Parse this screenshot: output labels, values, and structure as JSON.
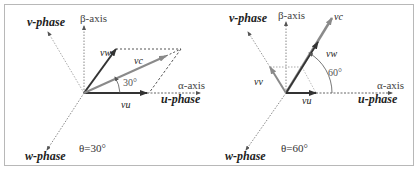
{
  "panels": [
    {
      "id": "left",
      "theta_label": "θ=30°",
      "labels": {
        "v_phase": "v-phase",
        "u_phase": "u-phase",
        "w_phase": "w-phase",
        "beta_axis": "β-axis",
        "alpha_axis": "α-axis",
        "vec_u": "vu",
        "vec_w": "vw",
        "vec_c": "vc",
        "angle": "30°"
      }
    },
    {
      "id": "right",
      "theta_label": "θ=60°",
      "labels": {
        "v_phase": "v-phase",
        "u_phase": "u-phase",
        "w_phase": "w-phase",
        "beta_axis": "β-axis",
        "alpha_axis": "α-axis",
        "vec_u": "vu",
        "vec_w": "vw",
        "vec_c": "vc",
        "vec_v": "vv",
        "angle": "60°"
      }
    }
  ],
  "colors": {
    "frame": "#b8b8b8",
    "dark_vector": "#333333",
    "grey_vector": "#8a8a8a",
    "dotted_axis": "#888888"
  }
}
